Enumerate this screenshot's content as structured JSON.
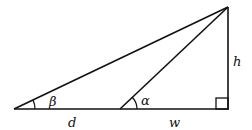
{
  "diagram": {
    "type": "right-triangle-angles-of-elevation",
    "points": {
      "A": [
        14,
        109
      ],
      "B": [
        120,
        109
      ],
      "C": [
        228,
        109
      ],
      "T": [
        228,
        7
      ]
    },
    "labels": {
      "beta": "β",
      "alpha": "α",
      "h": "h",
      "d": "d",
      "w": "w"
    },
    "stroke_color": "#111111"
  }
}
